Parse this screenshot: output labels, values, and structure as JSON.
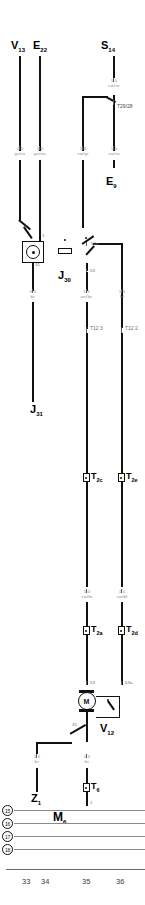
{
  "diagram": {
    "sheet_columns": [
      "33",
      "34",
      "35",
      "36"
    ],
    "left_index_circles": [
      "15",
      "16",
      "17",
      "18"
    ]
  },
  "components": [
    {
      "id": "V13",
      "letter": "V",
      "sub": "13",
      "name": "component-v13"
    },
    {
      "id": "E22",
      "letter": "E",
      "sub": "22",
      "name": "component-e22"
    },
    {
      "id": "S14",
      "letter": "S",
      "sub": "14",
      "name": "component-s14"
    },
    {
      "id": "E9",
      "letter": "E",
      "sub": "9",
      "name": "component-e9"
    },
    {
      "id": "J30",
      "letter": "J",
      "sub": "30",
      "name": "component-j30"
    },
    {
      "id": "J31",
      "letter": "J",
      "sub": "31",
      "name": "component-j31"
    },
    {
      "id": "V12",
      "letter": "V",
      "sub": "12",
      "name": "component-v12"
    },
    {
      "id": "Z1",
      "letter": "Z",
      "sub": "1",
      "name": "component-z1"
    },
    {
      "id": "M6",
      "letter": "M",
      "sub": "6",
      "name": "component-m6"
    }
  ],
  "connectors": [
    {
      "id": "T29/28",
      "label": "T29/28",
      "name": "connector-t29-28"
    },
    {
      "id": "T12/3",
      "label": "T12 3",
      "name": "connector-t12-3"
    },
    {
      "id": "T12/2",
      "label": "T12 2",
      "name": "connector-t12-2"
    },
    {
      "id": "T2c",
      "letter": "T",
      "sub": "2c",
      "name": "connector-t2c"
    },
    {
      "id": "T2e",
      "letter": "T",
      "sub": "2e",
      "name": "connector-t2e"
    },
    {
      "id": "T2a",
      "letter": "T",
      "sub": "2a",
      "name": "connector-t2a"
    },
    {
      "id": "T2d",
      "letter": "T",
      "sub": "2d",
      "name": "connector-t2d"
    },
    {
      "id": "T6",
      "letter": "T",
      "sub": "6",
      "name": "connector-t6"
    }
  ],
  "wires": [
    {
      "id": "w1",
      "gauge": "1.0",
      "color": "gn/ro",
      "name": "wire-spec-gn-ro"
    },
    {
      "id": "w2",
      "gauge": "1.0",
      "color": "gn/ws",
      "name": "wire-spec-gn-ws"
    },
    {
      "id": "w3",
      "gauge": "1.0",
      "color": "sw/gr",
      "name": "wire-spec-sw-gr"
    },
    {
      "id": "w4",
      "gauge": "1.5",
      "color": "sw/ro",
      "name": "wire-spec-sw-ro-upper"
    },
    {
      "id": "w5",
      "gauge": "1.5",
      "color": "sw/ro",
      "name": "wire-spec-sw-ro-top"
    },
    {
      "id": "w6",
      "gauge": "0.5",
      "color": "br",
      "name": "wire-spec-br-left"
    },
    {
      "id": "w7",
      "gauge": "1.5",
      "color": "ws/br",
      "name": "wire-spec-ws-br"
    },
    {
      "id": "w8",
      "gauge": "1.5",
      "color": "bl",
      "name": "wire-spec-bl"
    },
    {
      "id": "w9",
      "gauge": "1.0",
      "color": "sw/br",
      "name": "wire-spec-sw-br"
    },
    {
      "id": "w10",
      "gauge": "1.0",
      "color": "sw/bl",
      "name": "wire-spec-sw-bl"
    },
    {
      "id": "w11",
      "gauge": "1.5",
      "color": "br",
      "name": "wire-spec-br-z1"
    },
    {
      "id": "w12",
      "gauge": "1.5",
      "color": "br",
      "name": "wire-spec-br-t6"
    },
    {
      "id": "w13",
      "gauge": "1.5",
      "color": "",
      "name": "wire-spec-motor-out"
    }
  ],
  "terminals": [
    {
      "id": "t1",
      "label": "1",
      "name": "terminal-1"
    },
    {
      "id": "t31a",
      "label": "31",
      "name": "terminal-31-lamp"
    },
    {
      "id": "t53a",
      "label": "53a",
      "name": "terminal-53a-switch"
    },
    {
      "id": "t53",
      "label": "53",
      "name": "terminal-53-switch"
    },
    {
      "id": "t53m",
      "label": "53",
      "name": "terminal-53-motor"
    },
    {
      "id": "t53am",
      "label": "53a",
      "name": "terminal-53a-motor"
    },
    {
      "id": "t31m",
      "label": "31",
      "name": "terminal-31-motor"
    },
    {
      "id": "t6t",
      "label": "1",
      "name": "terminal-t6-1"
    }
  ]
}
